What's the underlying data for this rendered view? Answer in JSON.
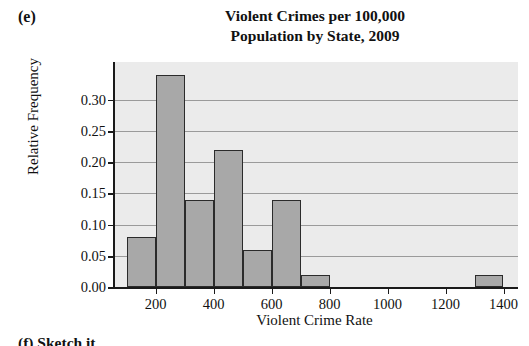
{
  "panel": {
    "label": "(e)"
  },
  "next_panel": {
    "label": "(f)  Sketch it"
  },
  "colors": {
    "plot_background": "#ebebeb",
    "bar_fill": "#a8a8a8",
    "bar_border": "#2b2b2b",
    "gridline": "#9a9a9a",
    "axis": "#1a1a1a",
    "text": "#111111",
    "page_background": "#ffffff"
  },
  "chart_data": {
    "type": "bar",
    "title": "Violent Crimes per 100,000 Population by State, 2009",
    "title_lines": [
      "Violent Crimes per 100,000",
      "Population by State, 2009"
    ],
    "subtitle": "",
    "xlabel": "Violent Crime Rate",
    "ylabel": "Relative Frequency",
    "histogram": true,
    "bin_width": 100,
    "xlim": [
      60,
      1450
    ],
    "ylim": [
      0.0,
      0.36
    ],
    "xticks": [
      200,
      400,
      600,
      800,
      1000,
      1200,
      1400
    ],
    "xtick_labels": [
      "200",
      "400",
      "600",
      "800",
      "1000",
      "1200",
      "1400"
    ],
    "yticks": [
      0.0,
      0.05,
      0.1,
      0.15,
      0.2,
      0.25,
      0.3
    ],
    "ytick_labels": [
      "0.00",
      "0.05",
      "0.10",
      "0.15",
      "0.20",
      "0.25",
      "0.30"
    ],
    "grid": true,
    "grid_axis": "y",
    "legend": null,
    "bins": [
      {
        "bin_start": 100,
        "bin_end": 200,
        "value": 0.08
      },
      {
        "bin_start": 200,
        "bin_end": 300,
        "value": 0.34
      },
      {
        "bin_start": 300,
        "bin_end": 400,
        "value": 0.14
      },
      {
        "bin_start": 400,
        "bin_end": 500,
        "value": 0.22
      },
      {
        "bin_start": 500,
        "bin_end": 600,
        "value": 0.06
      },
      {
        "bin_start": 600,
        "bin_end": 700,
        "value": 0.14
      },
      {
        "bin_start": 700,
        "bin_end": 800,
        "value": 0.02
      },
      {
        "bin_start": 1300,
        "bin_end": 1400,
        "value": 0.02
      }
    ],
    "categories": [
      "100-200",
      "200-300",
      "300-400",
      "400-500",
      "500-600",
      "600-700",
      "700-800",
      "1300-1400"
    ],
    "values": [
      0.08,
      0.34,
      0.14,
      0.22,
      0.06,
      0.14,
      0.02,
      0.02
    ]
  }
}
